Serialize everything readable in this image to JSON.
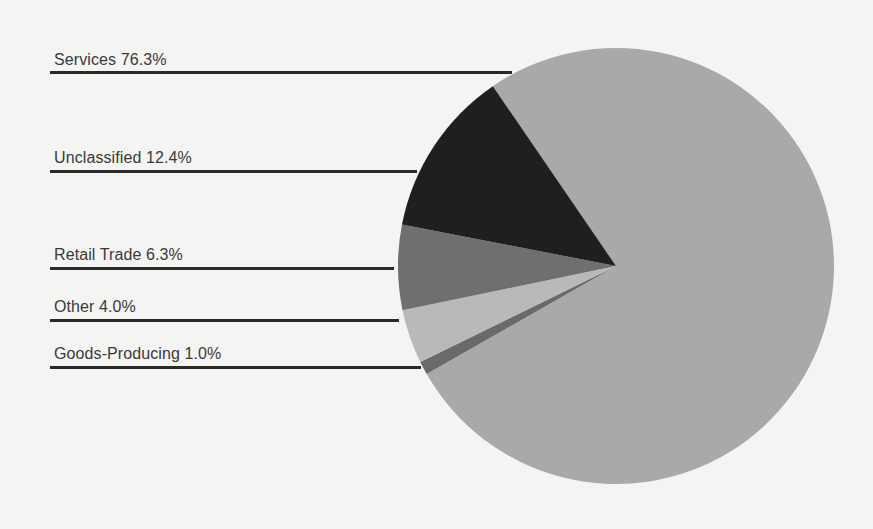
{
  "chart_data": {
    "type": "pie",
    "title": "",
    "categories": [
      "Services",
      "Unclassified",
      "Retail Trade",
      "Other",
      "Goods-Producing"
    ],
    "values": [
      76.3,
      12.4,
      6.3,
      4.0,
      1.0
    ],
    "unit": "%",
    "labels": [
      "Services 76.3%",
      "Unclassified 12.4%",
      "Retail Trade 6.3%",
      "Other 4.0%",
      "Goods-Producing 1.0%"
    ],
    "colors": [
      "#a9a9a9",
      "#1f1f1f",
      "#6f6f6f",
      "#b9b9b9",
      "#6a6a6a"
    ],
    "legend_position": "left (leader lines)"
  },
  "labels": {
    "services": "Services 76.3%",
    "unclassified": "Unclassified 12.4%",
    "retail": "Retail Trade 6.3%",
    "other": "Other 4.0%",
    "goods": "Goods-Producing 1.0%"
  }
}
